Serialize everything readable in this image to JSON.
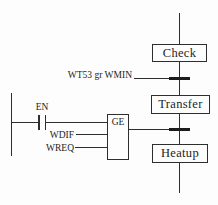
{
  "colors": {
    "background": "#fdfdfd",
    "line": "#2e2e2e",
    "text": "#1e1e1e"
  },
  "sfc": {
    "steps": [
      {
        "label": "Check"
      },
      {
        "label": "Transfer"
      },
      {
        "label": "Heatup"
      }
    ],
    "transition1": {
      "condition": "WT53 gr WMIN"
    }
  },
  "ladder": {
    "contact": {
      "label": "EN"
    },
    "function_block": {
      "label": "GE",
      "inputs": [
        {
          "label": "WDIF"
        },
        {
          "label": "WREQ"
        }
      ]
    }
  }
}
